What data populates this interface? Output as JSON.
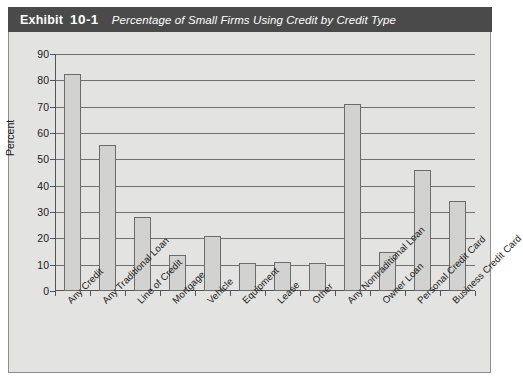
{
  "header": {
    "exhibit_word": "Exhibit",
    "exhibit_number": "10-1",
    "title": "Percentage of Small Firms Using Credit by Credit Type",
    "bar_color": "#4a4a4a",
    "text_color": "#ffffff"
  },
  "panel": {
    "background": "#e3e3e1",
    "border_color": "#8e8e8e"
  },
  "chart_data": {
    "type": "bar",
    "title": "Percentage of Small Firms Using Credit by Credit Type",
    "xlabel": "",
    "ylabel": "Percent",
    "ylim": [
      0,
      90
    ],
    "ytick_step": 10,
    "yticks": [
      0,
      10,
      20,
      30,
      40,
      50,
      60,
      70,
      80,
      90
    ],
    "grid": true,
    "legend": "none",
    "bar_fill": "#d2d2d0",
    "bar_edge": "#6b6b6b",
    "categories": [
      "Any Credit",
      "Any Traditional Loan",
      "Line of Credit",
      "Mortgage",
      "Vehicle",
      "Equipment",
      "Lease",
      "Other",
      "Any Nontraditional Loan",
      "Owner Loan",
      "Personal Credit Card",
      "Business Credit Card"
    ],
    "values": [
      82.5,
      55.5,
      28,
      13.5,
      21,
      10.5,
      11,
      10.5,
      71,
      15,
      46,
      34
    ]
  }
}
